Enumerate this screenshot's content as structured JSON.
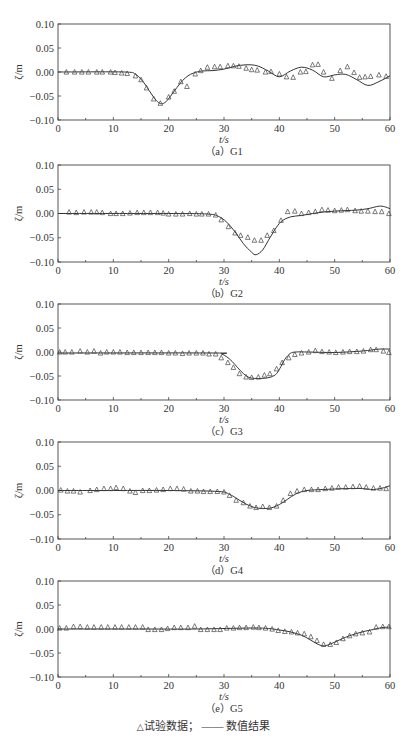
{
  "figure": {
    "legend": {
      "marker_symbol": "△",
      "experiment_label": "试验数据；",
      "line_symbol": "——",
      "numerical_label": "数值结果"
    },
    "colors": {
      "axis": "#444444",
      "line": "#333333",
      "marker": "#444444",
      "text": "#333333"
    }
  },
  "chart_data": [
    {
      "type": "line",
      "id": "G1",
      "caption": "（a）G1",
      "xlabel": "t/s",
      "ylabel": "ζ/m",
      "xlim": [
        0,
        60
      ],
      "ylim": [
        -0.1,
        0.1
      ],
      "xticks": [
        0,
        10,
        20,
        30,
        40,
        50,
        60
      ],
      "yticks": [
        "0.10",
        "0.05",
        "0.00",
        "-0.05",
        "-0.10"
      ],
      "grid": false,
      "frame": {
        "top": 24,
        "bottom": 120
      },
      "series": [
        {
          "name": "数值结果",
          "kind": "line",
          "x": [
            0,
            12,
            14,
            15,
            16,
            17,
            18,
            18.7,
            19.5,
            20.5,
            21.5,
            22.5,
            23.5,
            24.5,
            26,
            28,
            30,
            32,
            34,
            36,
            38,
            40,
            42,
            44,
            46,
            48,
            50,
            52,
            54,
            56,
            58,
            60
          ],
          "y": [
            0,
            0,
            -0.005,
            -0.015,
            -0.03,
            -0.048,
            -0.062,
            -0.066,
            -0.062,
            -0.048,
            -0.032,
            -0.018,
            -0.008,
            -0.002,
            0.002,
            0.003,
            0.006,
            0.012,
            0.015,
            0.013,
            0.002,
            -0.01,
            0.002,
            0.01,
            0.004,
            -0.01,
            -0.006,
            -0.005,
            -0.016,
            -0.028,
            -0.02,
            -0.008
          ]
        },
        {
          "name": "试验数据",
          "kind": "marker",
          "x": [
            1.5,
            3,
            4.3,
            5.5,
            7,
            8,
            9.5,
            10.3,
            11.5,
            12.5,
            14,
            15,
            16,
            17.3,
            18.5,
            20,
            21,
            22.2,
            23.3,
            24.8,
            25.8,
            27,
            28.3,
            29.3,
            30.7,
            31.7,
            32.7,
            34,
            35,
            36,
            37.5,
            38.5,
            40,
            41.3,
            42.5,
            43.8,
            44.8,
            46,
            47,
            48,
            49.5,
            51,
            52.3,
            53.5,
            54.5,
            55.5,
            56.5,
            58,
            59.3
          ],
          "y": [
            0,
            0,
            0,
            0,
            0,
            0,
            0,
            -0.001,
            -0.002,
            -0.003,
            -0.008,
            -0.016,
            -0.033,
            -0.056,
            -0.065,
            -0.052,
            -0.04,
            -0.02,
            -0.03,
            -0.004,
            0.003,
            0.01,
            0.011,
            0.011,
            0.013,
            0.013,
            0.012,
            0.008,
            0.005,
            0.004,
            0,
            0.001,
            -0.004,
            -0.01,
            -0.011,
            0,
            0.001,
            0.015,
            0.016,
            0,
            -0.013,
            0.003,
            0.011,
            -0.001,
            -0.011,
            -0.01,
            -0.009,
            -0.006,
            -0.009
          ]
        }
      ]
    },
    {
      "type": "line",
      "id": "G2",
      "caption": "（b）G2",
      "xlabel": "t/s",
      "ylabel": "ζ/m",
      "xlim": [
        0,
        60
      ],
      "ylim": [
        -0.1,
        0.1
      ],
      "xticks": [
        0,
        10,
        20,
        30,
        40,
        50,
        60
      ],
      "yticks": [
        "0.10",
        "0.05",
        "0.00",
        "-0.05",
        "-0.10"
      ],
      "grid": false,
      "frame": {
        "top": 165,
        "bottom": 262
      },
      "series": [
        {
          "name": "数值结果",
          "kind": "line",
          "x": [
            0,
            20,
            27,
            29,
            30.5,
            32,
            33.5,
            35,
            35.8,
            37,
            38.3,
            39.5,
            40.5,
            42,
            44,
            46,
            48,
            50,
            52,
            54,
            56,
            58,
            59,
            60
          ],
          "y": [
            0,
            0,
            -0.001,
            -0.006,
            -0.018,
            -0.038,
            -0.062,
            -0.08,
            -0.085,
            -0.075,
            -0.05,
            -0.028,
            -0.015,
            -0.007,
            -0.004,
            0,
            0.003,
            0.005,
            0.006,
            0.007,
            0.01,
            0.015,
            0.014,
            0.01
          ]
        },
        {
          "name": "试验数据",
          "kind": "marker",
          "x": [
            2,
            3.3,
            4.7,
            6,
            7,
            8,
            9.5,
            10.5,
            11.7,
            13,
            14.3,
            15.5,
            16.7,
            18,
            19,
            20,
            21.3,
            22.5,
            23.8,
            25,
            26,
            27.2,
            28.5,
            29.5,
            30.8,
            32,
            33,
            34.3,
            35.5,
            36.7,
            37.8,
            39,
            40.3,
            41.5,
            42.8,
            44,
            45.3,
            46.5,
            47.7,
            48.8,
            50,
            51.2,
            52.3,
            53.7,
            54.8,
            56,
            57.3,
            58.5,
            59.8
          ],
          "y": [
            0.003,
            0.002,
            0.003,
            0.003,
            0.003,
            0.002,
            0,
            0,
            0,
            0.001,
            0.002,
            0.002,
            0.002,
            0.002,
            0.001,
            -0.001,
            -0.001,
            -0.001,
            0,
            -0.001,
            -0.001,
            -0.001,
            -0.003,
            -0.013,
            -0.027,
            -0.04,
            -0.045,
            -0.049,
            -0.055,
            -0.055,
            -0.045,
            -0.035,
            -0.014,
            0.004,
            0.005,
            0,
            0.002,
            0.004,
            0.008,
            0.007,
            0.006,
            0.007,
            0.008,
            0.006,
            0.005,
            0.005,
            0.004,
            0.004,
            0
          ]
        }
      ]
    },
    {
      "type": "line",
      "id": "G3",
      "caption": "（c）G3",
      "xlabel": "t/s",
      "ylabel": "ζ/m",
      "xlim": [
        0,
        60
      ],
      "ylim": [
        -0.1,
        0.1
      ],
      "xticks": [
        0,
        10,
        20,
        30,
        40,
        50,
        60
      ],
      "yticks": [
        "0.10",
        "0.05",
        "0.00",
        "-0.05",
        "-0.10"
      ],
      "grid": false,
      "frame": {
        "top": 304,
        "bottom": 400
      },
      "series": [
        {
          "name": "数值结果",
          "kind": "line",
          "x": [
            0,
            28,
            29.5,
            30.5,
            31.5,
            32.5,
            33.5,
            34.5,
            35.5,
            37,
            38.5,
            39.5,
            40.3,
            41,
            42,
            43,
            45,
            50,
            55,
            58,
            60
          ],
          "y": [
            -0.002,
            -0.002,
            -0.004,
            -0.01,
            -0.02,
            -0.033,
            -0.045,
            -0.053,
            -0.055,
            -0.055,
            -0.052,
            -0.045,
            -0.03,
            -0.015,
            -0.003,
            0,
            0,
            -0.001,
            0.002,
            0.006,
            0.006
          ]
        },
        {
          "name": "试验数据",
          "kind": "marker",
          "x": [
            0.3,
            1.3,
            2.5,
            4,
            5.3,
            6.5,
            7.7,
            8.8,
            10,
            11.2,
            12.5,
            13.7,
            15,
            16.3,
            17.5,
            18.7,
            20,
            21.2,
            22.5,
            23.7,
            25,
            26.2,
            27.3,
            28.5,
            29.5,
            30.7,
            31.7,
            32.8,
            34,
            35,
            36.2,
            37.3,
            38.3,
            39.5,
            40.5,
            41.7,
            42.8,
            44,
            45.3,
            46.5,
            47.7,
            49,
            50.2,
            51.5,
            52.7,
            54,
            55.2,
            56.5,
            57.5,
            58.8,
            59.8
          ],
          "y": [
            0,
            0,
            0,
            0.002,
            0,
            0.002,
            -0.002,
            0,
            0,
            0,
            -0.001,
            -0.001,
            -0.001,
            -0.001,
            -0.001,
            -0.001,
            -0.002,
            -0.002,
            -0.003,
            -0.002,
            -0.002,
            -0.002,
            -0.004,
            -0.004,
            -0.012,
            -0.022,
            -0.032,
            -0.045,
            -0.052,
            -0.053,
            -0.052,
            -0.048,
            -0.045,
            -0.035,
            -0.022,
            -0.012,
            -0.005,
            -0.002,
            0,
            0.003,
            0.001,
            0,
            -0.001,
            0,
            0.001,
            0.001,
            0.002,
            0.005,
            0.005,
            0.002,
            -0.001
          ]
        }
      ]
    },
    {
      "type": "line",
      "id": "G4",
      "caption": "（d）G4",
      "xlabel": "t/s",
      "ylabel": "ζ/m",
      "xlim": [
        0,
        60
      ],
      "ylim": [
        -0.1,
        0.1
      ],
      "xticks": [
        0,
        10,
        20,
        30,
        40,
        50,
        60
      ],
      "yticks": [
        "0.10",
        "0.05",
        "0.00",
        "-0.05",
        "-0.10"
      ],
      "grid": false,
      "frame": {
        "top": 442,
        "bottom": 539
      },
      "series": [
        {
          "name": "数值结果",
          "kind": "line",
          "x": [
            0,
            10,
            20,
            29,
            31,
            32.5,
            34,
            35.5,
            37,
            38.5,
            40,
            41.5,
            43,
            45,
            48,
            52,
            55,
            57,
            59,
            60
          ],
          "y": [
            0,
            0,
            0,
            -0.002,
            -0.008,
            -0.018,
            -0.028,
            -0.035,
            -0.037,
            -0.036,
            -0.029,
            -0.018,
            -0.007,
            0,
            0.002,
            0.004,
            0.004,
            0.002,
            0.006,
            0.01
          ]
        },
        {
          "name": "试验数据",
          "kind": "marker",
          "x": [
            0.5,
            1.7,
            2.8,
            4,
            5.8,
            7,
            8.3,
            9.5,
            10.5,
            11.8,
            13,
            14,
            15.3,
            16.5,
            17.8,
            19,
            20.3,
            21.5,
            22.7,
            24,
            25.2,
            26.3,
            27.5,
            28.8,
            30,
            31,
            32.2,
            33.5,
            34.7,
            35.8,
            37,
            38.2,
            39.5,
            40.7,
            42,
            43.2,
            44.5,
            45.8,
            47,
            48.3,
            49.5,
            50.7,
            52,
            53.3,
            54.5,
            55.7,
            57,
            58.2,
            59.3
          ],
          "y": [
            0.001,
            -0.001,
            -0.001,
            -0.003,
            0,
            0.002,
            0.004,
            0.004,
            0.006,
            0.004,
            -0.001,
            -0.004,
            0,
            0,
            0.001,
            0.002,
            0.004,
            0.004,
            0.003,
            -0.001,
            -0.001,
            -0.002,
            -0.002,
            -0.002,
            -0.003,
            -0.01,
            -0.02,
            -0.025,
            -0.032,
            -0.035,
            -0.033,
            -0.035,
            -0.032,
            -0.02,
            -0.006,
            -0.001,
            0.002,
            0.002,
            0.002,
            0.004,
            0.005,
            0.007,
            0.007,
            0.008,
            0.009,
            0.007,
            0.005,
            0.005,
            0.004
          ]
        }
      ]
    },
    {
      "type": "line",
      "id": "G5",
      "caption": "（e）G5",
      "xlabel": "t/s",
      "ylabel": "ζ/m",
      "xlim": [
        0,
        60
      ],
      "ylim": [
        -0.1,
        0.1
      ],
      "xticks": [
        0,
        10,
        20,
        30,
        40,
        50,
        60
      ],
      "yticks": [
        "0.10",
        "0.05",
        "0.00",
        "-0.05",
        "-0.10"
      ],
      "grid": false,
      "frame": {
        "top": 581,
        "bottom": 677
      },
      "series": [
        {
          "name": "数值结果",
          "kind": "line",
          "x": [
            0,
            15,
            25,
            35,
            38,
            40,
            42,
            44,
            45.5,
            47,
            48.2,
            49.5,
            51,
            53,
            55,
            57,
            58.5,
            60
          ],
          "y": [
            0,
            0,
            0,
            0.002,
            0.001,
            -0.002,
            -0.006,
            -0.013,
            -0.022,
            -0.032,
            -0.035,
            -0.03,
            -0.022,
            -0.013,
            -0.006,
            -0.001,
            0.003,
            0.004
          ]
        },
        {
          "name": "试验数据",
          "kind": "marker",
          "x": [
            0.3,
            1.5,
            2.8,
            4,
            5.3,
            6.5,
            7.8,
            9,
            10.3,
            11.5,
            12.8,
            14,
            15.3,
            16.3,
            17.5,
            18.7,
            19.8,
            21,
            22.2,
            23.5,
            24.7,
            25.8,
            27,
            28.2,
            29.3,
            30.5,
            31.7,
            32.8,
            34,
            35.3,
            36.3,
            37.5,
            38.7,
            39.8,
            41,
            42.2,
            43.3,
            44.5,
            45.7,
            46.8,
            48,
            49.2,
            50.3,
            51.5,
            52.7,
            53.8,
            55,
            56.3,
            57.5,
            58.7,
            59.8
          ],
          "y": [
            0.002,
            0.002,
            0.005,
            0.005,
            0.004,
            0.004,
            0.004,
            0.004,
            0.004,
            0.004,
            0.004,
            0.004,
            0.004,
            -0.001,
            -0.001,
            -0.001,
            0.001,
            0.003,
            0.003,
            0.003,
            0.006,
            -0.001,
            -0.001,
            -0.001,
            -0.001,
            0.002,
            0.002,
            0.003,
            0.003,
            0.004,
            0.003,
            0.002,
            0,
            -0.003,
            -0.005,
            -0.006,
            -0.008,
            -0.01,
            -0.016,
            -0.024,
            -0.032,
            -0.032,
            -0.028,
            -0.02,
            -0.014,
            -0.01,
            -0.008,
            -0.006,
            0.004,
            0.005,
            0.005
          ]
        }
      ]
    }
  ]
}
